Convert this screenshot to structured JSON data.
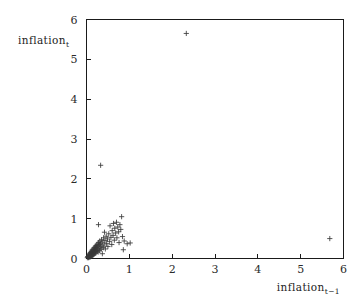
{
  "chart_data": {
    "type": "scatter",
    "title": "",
    "xlabel": "inflation_{t-1}",
    "ylabel": "inflation_t",
    "xlabel_base": "inflation",
    "xlabel_sub": "t−1",
    "ylabel_base": "inflation",
    "ylabel_sub": "t",
    "xlim": [
      0,
      6
    ],
    "ylim": [
      0,
      6
    ],
    "xticks": [
      0,
      1,
      2,
      3,
      4,
      5,
      6
    ],
    "yticks": [
      0,
      1,
      2,
      3,
      4,
      5,
      6
    ],
    "xtick_labels": [
      "0",
      "1",
      "2",
      "3",
      "4",
      "5",
      "6"
    ],
    "ytick_labels": [
      "0",
      "1",
      "2",
      "3",
      "4",
      "5",
      "6"
    ],
    "grid": false,
    "legend": null,
    "marker": "plus",
    "marker_color": "#3a3a3a",
    "frame_color": "#1a1a1a",
    "background_color": "#ffffff",
    "points": [
      [
        0.02,
        0.02
      ],
      [
        0.03,
        0.05
      ],
      [
        0.04,
        0.03
      ],
      [
        0.05,
        0.07
      ],
      [
        0.05,
        0.02
      ],
      [
        0.06,
        0.09
      ],
      [
        0.06,
        0.04
      ],
      [
        0.07,
        0.12
      ],
      [
        0.07,
        0.06
      ],
      [
        0.08,
        0.03
      ],
      [
        0.08,
        0.1
      ],
      [
        0.09,
        0.15
      ],
      [
        0.09,
        0.07
      ],
      [
        0.1,
        0.05
      ],
      [
        0.1,
        0.13
      ],
      [
        0.11,
        0.18
      ],
      [
        0.11,
        0.09
      ],
      [
        0.12,
        0.16
      ],
      [
        0.12,
        0.06
      ],
      [
        0.13,
        0.21
      ],
      [
        0.13,
        0.11
      ],
      [
        0.14,
        0.14
      ],
      [
        0.14,
        0.08
      ],
      [
        0.15,
        0.23
      ],
      [
        0.15,
        0.12
      ],
      [
        0.16,
        0.19
      ],
      [
        0.16,
        0.09
      ],
      [
        0.17,
        0.26
      ],
      [
        0.17,
        0.15
      ],
      [
        0.18,
        0.22
      ],
      [
        0.18,
        0.11
      ],
      [
        0.19,
        0.28
      ],
      [
        0.19,
        0.17
      ],
      [
        0.2,
        0.24
      ],
      [
        0.2,
        0.13
      ],
      [
        0.21,
        0.31
      ],
      [
        0.21,
        0.19
      ],
      [
        0.22,
        0.27
      ],
      [
        0.22,
        0.14
      ],
      [
        0.23,
        0.33
      ],
      [
        0.23,
        0.21
      ],
      [
        0.24,
        0.29
      ],
      [
        0.25,
        0.18
      ],
      [
        0.25,
        0.36
      ],
      [
        0.26,
        0.24
      ],
      [
        0.27,
        0.32
      ],
      [
        0.27,
        0.16
      ],
      [
        0.28,
        0.4
      ],
      [
        0.29,
        0.26
      ],
      [
        0.3,
        0.35
      ],
      [
        0.3,
        0.2
      ],
      [
        0.31,
        0.44
      ],
      [
        0.32,
        0.29
      ],
      [
        0.33,
        0.38
      ],
      [
        0.34,
        0.23
      ],
      [
        0.35,
        0.47
      ],
      [
        0.36,
        0.31
      ],
      [
        0.37,
        0.12
      ],
      [
        0.38,
        0.41
      ],
      [
        0.39,
        0.27
      ],
      [
        0.4,
        0.52
      ],
      [
        0.41,
        0.34
      ],
      [
        0.43,
        0.45
      ],
      [
        0.44,
        0.24
      ],
      [
        0.46,
        0.56
      ],
      [
        0.47,
        0.38
      ],
      [
        0.49,
        0.49
      ],
      [
        0.5,
        0.3
      ],
      [
        0.52,
        0.62
      ],
      [
        0.54,
        0.43
      ],
      [
        0.55,
        0.82
      ],
      [
        0.57,
        0.53
      ],
      [
        0.59,
        0.35
      ],
      [
        0.6,
        0.7
      ],
      [
        0.62,
        0.58
      ],
      [
        0.63,
        0.88
      ],
      [
        0.65,
        0.46
      ],
      [
        0.66,
        0.76
      ],
      [
        0.68,
        0.64
      ],
      [
        0.7,
        0.91
      ],
      [
        0.71,
        0.52
      ],
      [
        0.73,
        0.79
      ],
      [
        0.75,
        0.67
      ],
      [
        0.76,
        0.4
      ],
      [
        0.78,
        0.85
      ],
      [
        0.8,
        0.73
      ],
      [
        0.82,
        1.05
      ],
      [
        0.84,
        0.55
      ],
      [
        0.86,
        0.22
      ],
      [
        0.88,
        0.44
      ],
      [
        0.95,
        0.37
      ],
      [
        1.02,
        0.39
      ],
      [
        0.28,
        0.85
      ],
      [
        0.42,
        0.66
      ],
      [
        0.33,
        2.34
      ],
      [
        2.33,
        5.65
      ],
      [
        5.68,
        0.5
      ]
    ],
    "n_points": 97
  }
}
